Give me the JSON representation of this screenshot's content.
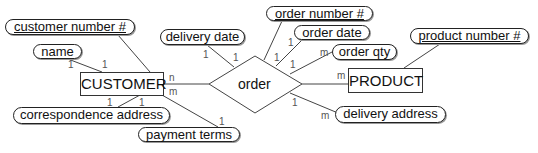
{
  "diagram": {
    "type": "entity-relationship",
    "entities": [
      {
        "id": "customer",
        "label": "CUSTOMER"
      },
      {
        "id": "product",
        "label": "PRODUCT"
      }
    ],
    "relationship": {
      "id": "order",
      "label": "order"
    },
    "attributes": [
      {
        "id": "customer_number",
        "label": "customer number #",
        "key": true,
        "of": "CUSTOMER"
      },
      {
        "id": "name",
        "label": "name",
        "key": false,
        "of": "CUSTOMER"
      },
      {
        "id": "correspondence_address",
        "label": "correspondence address",
        "key": false,
        "of": "CUSTOMER"
      },
      {
        "id": "payment_terms",
        "label": "payment terms",
        "key": false,
        "of": "CUSTOMER"
      },
      {
        "id": "delivery_date",
        "label": "delivery date",
        "key": false,
        "of": "order"
      },
      {
        "id": "order_number",
        "label": "order number #",
        "key": true,
        "of": "order"
      },
      {
        "id": "order_date",
        "label": "order date",
        "key": false,
        "of": "order"
      },
      {
        "id": "order_qty",
        "label": "order qty",
        "key": false,
        "of": "order"
      },
      {
        "id": "delivery_address",
        "label": "delivery address",
        "key": false,
        "of": "order"
      },
      {
        "id": "product_number",
        "label": "product number #",
        "key": true,
        "of": "PRODUCT"
      }
    ],
    "cardinalities": {
      "name_left": "1",
      "name_right": "1",
      "corr_left": "1",
      "corr_right": "1",
      "customer_order_n": "n",
      "customer_order_m": "m",
      "payment_terms": "1",
      "delivery_date_left": "1",
      "delivery_date_right": "1",
      "order_number": "1",
      "order_date_top": "1",
      "order_date_bottom": "1",
      "order_qty": "m",
      "order_product": "m",
      "delivery_address_top": "1",
      "delivery_address_bottom": "m"
    }
  }
}
